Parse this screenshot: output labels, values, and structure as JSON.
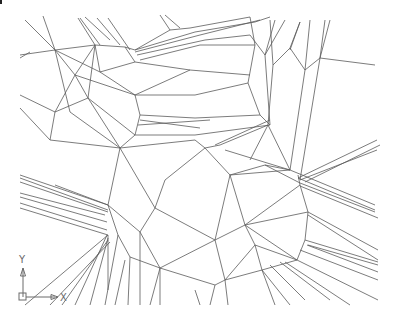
{
  "view": {
    "background": "#ffffff",
    "line_color": "#5a5a5a",
    "width": 398,
    "height": 320
  },
  "ucs_icon": {
    "x_label": "X",
    "y_label": "Y",
    "origin": [
      18,
      297
    ],
    "color": "#6a6a6a"
  },
  "mesh_lines": [
    [
      25,
      20,
      55,
      50
    ],
    [
      43,
      16,
      55,
      50
    ],
    [
      78,
      18,
      95,
      45
    ],
    [
      80,
      18,
      100,
      45
    ],
    [
      85,
      17,
      110,
      40
    ],
    [
      97,
      18,
      120,
      45
    ],
    [
      108,
      18,
      130,
      50
    ],
    [
      20,
      55,
      55,
      50
    ],
    [
      20,
      58,
      30,
      52
    ],
    [
      55,
      50,
      95,
      45
    ],
    [
      95,
      45,
      125,
      47
    ],
    [
      125,
      47,
      135,
      50
    ],
    [
      55,
      50,
      70,
      112
    ],
    [
      55,
      50,
      75,
      75
    ],
    [
      20,
      95,
      55,
      112
    ],
    [
      20,
      108,
      50,
      140
    ],
    [
      55,
      112,
      50,
      140
    ],
    [
      55,
      112,
      88,
      98
    ],
    [
      88,
      98,
      95,
      45
    ],
    [
      88,
      98,
      75,
      75
    ],
    [
      75,
      75,
      95,
      45
    ],
    [
      55,
      112,
      75,
      75
    ],
    [
      55,
      50,
      100,
      72
    ],
    [
      100,
      72,
      135,
      62
    ],
    [
      95,
      45,
      100,
      72
    ],
    [
      125,
      47,
      135,
      62
    ],
    [
      135,
      50,
      170,
      30
    ],
    [
      135,
      50,
      195,
      32
    ],
    [
      135,
      52,
      200,
      35
    ],
    [
      137,
      55,
      205,
      40
    ],
    [
      140,
      60,
      200,
      45
    ],
    [
      170,
      30,
      190,
      28
    ],
    [
      190,
      28,
      250,
      17
    ],
    [
      195,
      32,
      255,
      22
    ],
    [
      200,
      35,
      260,
      20
    ],
    [
      200,
      45,
      255,
      45
    ],
    [
      205,
      40,
      250,
      35
    ],
    [
      135,
      62,
      190,
      70
    ],
    [
      190,
      70,
      250,
      75
    ],
    [
      100,
      72,
      135,
      95
    ],
    [
      135,
      95,
      190,
      70
    ],
    [
      135,
      95,
      195,
      95
    ],
    [
      195,
      95,
      248,
      83
    ],
    [
      135,
      95,
      140,
      115
    ],
    [
      140,
      115,
      195,
      118
    ],
    [
      195,
      118,
      260,
      115
    ],
    [
      140,
      115,
      135,
      135
    ],
    [
      135,
      135,
      195,
      135
    ],
    [
      195,
      135,
      270,
      125
    ],
    [
      140,
      120,
      200,
      128
    ],
    [
      138,
      125,
      210,
      120
    ],
    [
      135,
      135,
      120,
      148
    ],
    [
      120,
      148,
      195,
      140
    ],
    [
      70,
      112,
      120,
      148
    ],
    [
      75,
      75,
      135,
      95
    ],
    [
      50,
      140,
      120,
      148
    ],
    [
      88,
      98,
      135,
      135
    ],
    [
      88,
      98,
      120,
      148
    ],
    [
      250,
      17,
      255,
      45
    ],
    [
      255,
      45,
      248,
      83
    ],
    [
      248,
      83,
      260,
      115
    ],
    [
      260,
      115,
      270,
      125
    ],
    [
      250,
      35,
      265,
      55
    ],
    [
      265,
      55,
      270,
      125
    ],
    [
      255,
      22,
      270,
      17
    ],
    [
      265,
      55,
      285,
      20
    ],
    [
      265,
      55,
      275,
      20
    ],
    [
      270,
      20,
      273,
      65
    ],
    [
      273,
      65,
      290,
      48
    ],
    [
      290,
      48,
      300,
      22
    ],
    [
      290,
      48,
      305,
      70
    ],
    [
      305,
      70,
      310,
      20
    ],
    [
      305,
      70,
      320,
      58
    ],
    [
      320,
      58,
      330,
      20
    ],
    [
      320,
      58,
      325,
      20
    ],
    [
      320,
      58,
      375,
      65
    ],
    [
      273,
      65,
      268,
      125
    ],
    [
      300,
      22,
      290,
      50
    ],
    [
      305,
      70,
      290,
      170
    ],
    [
      320,
      58,
      300,
      180
    ],
    [
      268,
      125,
      250,
      160
    ],
    [
      268,
      125,
      290,
      170
    ],
    [
      120,
      148,
      108,
      205
    ],
    [
      120,
      148,
      155,
      208
    ],
    [
      108,
      205,
      55,
      185
    ],
    [
      108,
      205,
      20,
      175
    ],
    [
      20,
      178,
      108,
      210
    ],
    [
      20,
      182,
      108,
      212
    ],
    [
      20,
      193,
      105,
      215
    ],
    [
      20,
      197,
      107,
      222
    ],
    [
      20,
      203,
      107,
      230
    ],
    [
      20,
      208,
      108,
      235
    ],
    [
      108,
      205,
      140,
      232
    ],
    [
      108,
      205,
      118,
      235
    ],
    [
      155,
      208,
      140,
      232
    ],
    [
      155,
      208,
      165,
      180
    ],
    [
      165,
      180,
      205,
      148
    ],
    [
      205,
      148,
      230,
      175
    ],
    [
      195,
      140,
      205,
      148
    ],
    [
      205,
      148,
      220,
      145
    ],
    [
      220,
      145,
      268,
      125
    ],
    [
      215,
      145,
      270,
      120
    ],
    [
      225,
      150,
      290,
      170
    ],
    [
      230,
      175,
      290,
      170
    ],
    [
      155,
      208,
      215,
      240
    ],
    [
      140,
      232,
      160,
      268
    ],
    [
      118,
      235,
      130,
      257
    ],
    [
      130,
      257,
      160,
      268
    ],
    [
      160,
      268,
      215,
      240
    ],
    [
      215,
      240,
      230,
      175
    ],
    [
      215,
      240,
      225,
      280
    ],
    [
      160,
      268,
      160,
      305
    ],
    [
      130,
      257,
      128,
      305
    ],
    [
      108,
      235,
      108,
      290
    ],
    [
      108,
      238,
      90,
      305
    ],
    [
      107,
      235,
      75,
      305
    ],
    [
      108,
      240,
      62,
      305
    ],
    [
      110,
      242,
      50,
      305
    ],
    [
      25,
      305,
      108,
      235
    ],
    [
      118,
      235,
      105,
      305
    ],
    [
      125,
      260,
      115,
      305
    ],
    [
      140,
      232,
      140,
      305
    ],
    [
      160,
      268,
      150,
      305
    ],
    [
      160,
      268,
      215,
      285
    ],
    [
      215,
      285,
      225,
      280
    ],
    [
      225,
      280,
      262,
      270
    ],
    [
      262,
      270,
      297,
      260
    ],
    [
      297,
      260,
      305,
      240
    ],
    [
      305,
      240,
      308,
      212
    ],
    [
      308,
      212,
      300,
      185
    ],
    [
      300,
      185,
      298,
      175
    ],
    [
      290,
      170,
      375,
      205
    ],
    [
      298,
      178,
      375,
      210
    ],
    [
      300,
      183,
      375,
      212
    ],
    [
      300,
      186,
      378,
      218
    ],
    [
      308,
      212,
      378,
      250
    ],
    [
      308,
      215,
      378,
      260
    ],
    [
      305,
      240,
      378,
      262
    ],
    [
      308,
      245,
      378,
      265
    ],
    [
      307,
      245,
      378,
      272
    ],
    [
      300,
      250,
      378,
      280
    ],
    [
      262,
      270,
      275,
      305
    ],
    [
      262,
      270,
      290,
      305
    ],
    [
      270,
      265,
      305,
      300
    ],
    [
      280,
      262,
      330,
      300
    ],
    [
      285,
      262,
      350,
      305
    ],
    [
      297,
      260,
      378,
      300
    ],
    [
      225,
      280,
      228,
      305
    ],
    [
      215,
      285,
      210,
      305
    ],
    [
      195,
      290,
      200,
      305
    ],
    [
      230,
      175,
      245,
      225
    ],
    [
      245,
      225,
      297,
      260
    ],
    [
      245,
      225,
      308,
      212
    ],
    [
      245,
      225,
      300,
      185
    ],
    [
      230,
      175,
      265,
      165
    ],
    [
      265,
      165,
      300,
      183
    ],
    [
      245,
      225,
      255,
      245
    ],
    [
      255,
      245,
      297,
      260
    ],
    [
      255,
      245,
      262,
      270
    ],
    [
      225,
      280,
      255,
      245
    ],
    [
      215,
      240,
      245,
      225
    ],
    [
      265,
      165,
      290,
      170
    ],
    [
      298,
      178,
      377,
      140
    ],
    [
      300,
      180,
      377,
      150
    ],
    [
      305,
      182,
      380,
      145
    ],
    [
      170,
      30,
      160,
      15
    ],
    [
      180,
      28,
      165,
      15
    ]
  ]
}
